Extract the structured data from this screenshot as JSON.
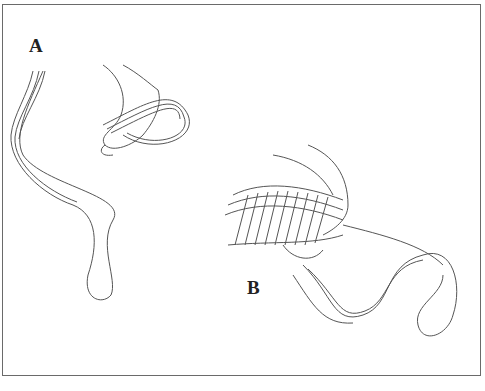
{
  "figure": {
    "labels": {
      "a": "A",
      "b": "B"
    },
    "panels": [
      {
        "id": "A",
        "description": "Hand holding bundled loop of cord"
      },
      {
        "id": "B",
        "description": "Hand wrapping cord around bundled loops"
      }
    ],
    "colors": {
      "line": "#555555",
      "border": "#6a6a6a",
      "background": "#ffffff"
    }
  }
}
